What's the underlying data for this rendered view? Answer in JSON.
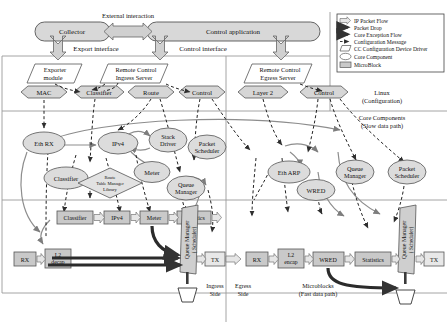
{
  "diagram": {
    "colors": {
      "node_fill": "#d8d8d8",
      "node_stroke": "#555555",
      "block_fill": "#c9c9c9",
      "arrow_gray": "#9a9a9a",
      "arrow_dark": "#3a3a3a",
      "divider": "#9a9a9a",
      "legend_border": "#444444"
    },
    "top": {
      "external_interaction_label": "External interaction",
      "collector": "Collector",
      "control_application": "Control application",
      "export_interface": "Export interface",
      "control_interface": "Control  interface"
    },
    "parallelograms": [
      {
        "name": "exporter-module",
        "line1": "Exporter",
        "line2": "module"
      },
      {
        "name": "remote-control-ingress-server",
        "line1": "Remote Control",
        "line2": "Ingress Server"
      },
      {
        "name": "remote-control-egress-server",
        "line1": "Remote Control",
        "line2": "Egress Server"
      }
    ],
    "hexagons": [
      {
        "name": "hex-mac",
        "label": "MAC"
      },
      {
        "name": "hex-classifier",
        "label": "Classifier"
      },
      {
        "name": "hex-route",
        "label": "Route"
      },
      {
        "name": "hex-control-ingress",
        "label": "Control"
      },
      {
        "name": "hex-layer2",
        "label": "Layer 2"
      },
      {
        "name": "hex-control-egress",
        "label": "Control"
      }
    ],
    "side_labels": {
      "linux_line1": "Linux",
      "linux_line2": "(Configuration)",
      "core_line1": "Core Components",
      "core_line2": "(Slow data path)"
    },
    "core_components_ingress": [
      {
        "name": "core-eth-rx",
        "label": "Eth RX"
      },
      {
        "name": "core-ipv4",
        "label": "IPv4"
      },
      {
        "name": "core-stack-driver",
        "line1": "Stack",
        "line2": "Driver"
      },
      {
        "name": "core-classifier",
        "label": "Classifier"
      },
      {
        "name": "core-meter",
        "label": "Meter"
      },
      {
        "name": "core-queue-manager",
        "line1": "Queue",
        "line2": "Manager"
      },
      {
        "name": "core-packet-scheduler",
        "line1": "Packet",
        "line2": "Scheduler"
      }
    ],
    "route_table_manager": {
      "line1": "Route",
      "line2": "Table Manager",
      "line3": "Library"
    },
    "core_components_egress": [
      {
        "name": "core-eth-arp",
        "label": "Eth ARP"
      },
      {
        "name": "core-wred",
        "label": "WRED"
      },
      {
        "name": "core-queue-manager-egress",
        "line1": "Queue",
        "line2": "Manager"
      },
      {
        "name": "core-packet-scheduler-egress",
        "line1": "Packet",
        "line2": "Scheduler"
      }
    ],
    "microblocks_ingress_upper": [
      {
        "name": "mb-classifier",
        "label": "Classifier"
      },
      {
        "name": "mb-ipv4",
        "label": "IPv4"
      },
      {
        "name": "mb-meter",
        "label": "Meter"
      },
      {
        "name": "mb-statistics",
        "label": "Statistics"
      }
    ],
    "microblocks_ingress_lower": [
      {
        "name": "mb-rx",
        "label": "RX"
      },
      {
        "name": "mb-l2-decap",
        "line1": "L2",
        "line2": "decap"
      },
      {
        "name": "mb-tx-ingress",
        "label": "TX"
      }
    ],
    "queue_manager_scheduler_ingress": {
      "line1": "Queue Manager",
      "line2": "( Scheduler)"
    },
    "microblocks_egress": [
      {
        "name": "mb-rx-egress",
        "label": "RX"
      },
      {
        "name": "mb-l2-encap",
        "line1": "L2",
        "line2": "encap"
      },
      {
        "name": "mb-wred",
        "label": "WRED"
      },
      {
        "name": "mb-statistics-egress",
        "label": "Statistics"
      },
      {
        "name": "mb-tx-egress",
        "label": "TX"
      }
    ],
    "queue_manager_scheduler_egress": {
      "line1": "Queue Manager",
      "line2": "( Scheduler)"
    },
    "bottom_labels": {
      "ingress_line1": "Ingress",
      "ingress_line2": "Side",
      "egress_line1": "Egress",
      "egress_line2": "Side",
      "microblocks_line1": "Microblocks",
      "microblocks_line2": "(Fast data path)"
    },
    "legend": {
      "items": [
        {
          "name": "legend-ip-packet-flow",
          "label": "IP Packet Flow",
          "glyph": "hollow-arrow-icon"
        },
        {
          "name": "legend-packet-drop",
          "label": "Packet Drop",
          "glyph": "thick-dark-arrow-icon"
        },
        {
          "name": "legend-core-exception-flow",
          "label": "Core Exception Flow",
          "glyph": "thick-dark-arrow-icon"
        },
        {
          "name": "legend-configuration-message",
          "label": "Configuration Message",
          "glyph": "dashed-arrow-icon"
        },
        {
          "name": "legend-cc-configuration-device-driver",
          "label": "CC Configuration Device Driver",
          "glyph": "parallelogram-icon"
        },
        {
          "name": "legend-core-component",
          "label": "Core Component",
          "glyph": "ellipse-icon"
        },
        {
          "name": "legend-microblock",
          "label": "MicroBlock",
          "glyph": "rectangle-icon"
        }
      ]
    }
  }
}
